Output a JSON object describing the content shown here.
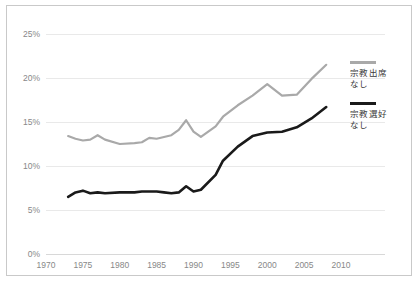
{
  "chart_data": {
    "type": "line",
    "title": "",
    "subtitle": "",
    "xlabel": "",
    "ylabel": "",
    "xlim": [
      1970,
      2010
    ],
    "ylim": [
      0,
      25
    ],
    "grid": true,
    "legend_position": "right",
    "x_ticks": [
      "1970",
      "1975",
      "1980",
      "1985",
      "1990",
      "1995",
      "2000",
      "2005",
      "2010"
    ],
    "y_ticks": [
      "0%",
      "5%",
      "10%",
      "15%",
      "20%",
      "25%"
    ],
    "x": [
      1973,
      1974,
      1975,
      1976,
      1977,
      1978,
      1980,
      1982,
      1983,
      1984,
      1985,
      1986,
      1987,
      1988,
      1989,
      1990,
      1991,
      1993,
      1994,
      1996,
      1998,
      2000,
      2002,
      2004,
      2006,
      2008
    ],
    "series": [
      {
        "name": "no-religious-attendance",
        "label_line1": "宗教出席",
        "label_line2": "なし",
        "color": "#a9a9a9",
        "values": [
          13.4,
          13.1,
          12.9,
          13.0,
          13.5,
          13.0,
          12.5,
          12.6,
          12.7,
          13.2,
          13.1,
          13.3,
          13.5,
          14.1,
          15.2,
          13.9,
          13.3,
          14.5,
          15.6,
          16.9,
          18.0,
          19.3,
          18.0,
          18.1,
          19.9,
          21.5
        ]
      },
      {
        "name": "no-religious-preference",
        "label_line1": "宗教選好",
        "label_line2": "なし",
        "color": "#1a1a1a",
        "values": [
          6.5,
          7.0,
          7.2,
          6.9,
          7.0,
          6.9,
          7.0,
          7.0,
          7.1,
          7.1,
          7.1,
          7.0,
          6.9,
          7.0,
          7.7,
          7.1,
          7.3,
          9.0,
          10.6,
          12.2,
          13.4,
          13.8,
          13.9,
          14.4,
          15.4,
          16.7
        ]
      }
    ]
  },
  "legend": {
    "entries": [
      {
        "line1": "宗教出席",
        "line2": "なし",
        "color": "#a9a9a9"
      },
      {
        "line1": "宗教選好",
        "line2": "なし",
        "color": "#1a1a1a"
      }
    ]
  },
  "colors": {
    "grey_series": "#a9a9a9",
    "black_series": "#1a1a1a",
    "gridline": "#e9e9e9",
    "frame": "#c9c9c9",
    "tick_text": "#888888"
  }
}
